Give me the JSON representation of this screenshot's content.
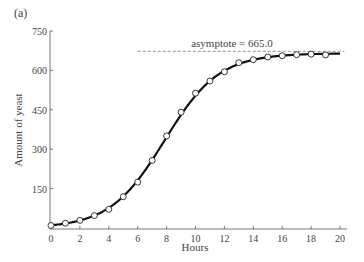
{
  "panel_label": "(a)",
  "chart_data": {
    "type": "line",
    "title": "",
    "xlabel": "Hours",
    "ylabel": "Amount of yeast",
    "xlim": [
      0,
      20
    ],
    "ylim": [
      0,
      750
    ],
    "x_ticks": [
      0,
      2,
      4,
      6,
      8,
      10,
      12,
      14,
      16,
      18,
      20
    ],
    "y_ticks": [
      150,
      300,
      450,
      600,
      750
    ],
    "grid": false,
    "annotation": "asymptote = 665.0",
    "asymptote": 665.0,
    "series": [
      {
        "name": "Observed",
        "style": "open-circle-markers",
        "x": [
          0,
          1,
          2,
          3,
          4,
          5,
          6,
          7,
          8,
          9,
          10,
          11,
          12,
          13,
          14,
          15,
          16,
          17,
          18,
          19
        ],
        "values": [
          9.6,
          18.3,
          29.0,
          47.2,
          71.1,
          119.1,
          174.6,
          257.3,
          350.7,
          441.0,
          513.3,
          559.7,
          594.8,
          629.4,
          640.8,
          651.1,
          655.9,
          659.6,
          661.8,
          659.0
        ]
      },
      {
        "name": "Logistic fit",
        "style": "solid-thick-line",
        "model": "665 / (1 + exp(4.16 - 0.53 t))",
        "x_range": [
          0,
          20
        ]
      }
    ]
  }
}
